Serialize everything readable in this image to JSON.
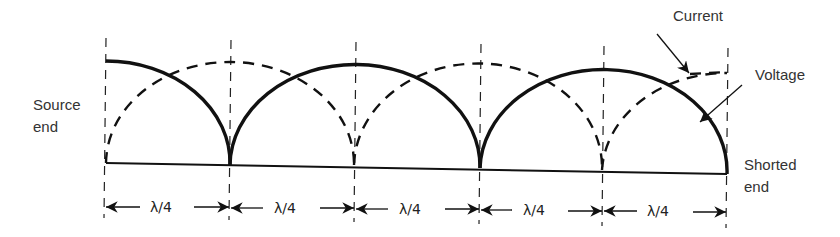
{
  "labels": {
    "source_line1": "Source",
    "source_line2": "end",
    "shorted_line1": "Shorted",
    "shorted_line2": "end",
    "current": "Current",
    "voltage": "Voltage"
  },
  "dimensions": [
    {
      "label": "λ/4"
    },
    {
      "label": "λ/4"
    },
    {
      "label": "λ/4"
    },
    {
      "label": "λ/4"
    },
    {
      "label": "λ/4"
    }
  ],
  "legend": {
    "voltage_style": "solid",
    "current_style": "dashed"
  },
  "colors": {
    "ink": "#111111",
    "text": "#333333",
    "background": "#ffffff"
  }
}
